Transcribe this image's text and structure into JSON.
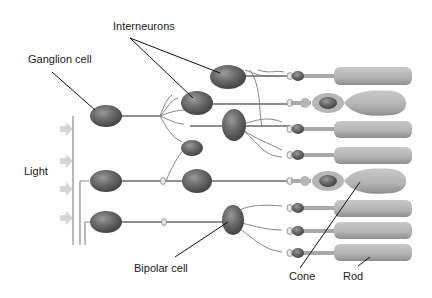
{
  "diagram": {
    "labels": {
      "interneurons": "Interneurons",
      "ganglion_cell": "Ganglion cell",
      "light": "Light",
      "bipolar_cell": "Bipolar cell",
      "cone": "Cone",
      "rod": "Rod"
    },
    "colors": {
      "cell_body": "#6e6e6e",
      "cell_dark": "#4a4a4a",
      "photoreceptor": "#b4b4b4",
      "arrow": "#d4d4d4",
      "line": "#6a6a6a",
      "leader": "#111111"
    },
    "photoreceptors": [
      {
        "type": "rod",
        "y": 76
      },
      {
        "type": "cone",
        "y": 103
      },
      {
        "type": "rod",
        "y": 129
      },
      {
        "type": "rod",
        "y": 155
      },
      {
        "type": "cone",
        "y": 181
      },
      {
        "type": "rod",
        "y": 208
      },
      {
        "type": "rod",
        "y": 231
      },
      {
        "type": "rod",
        "y": 253
      }
    ],
    "light_arrows": 4
  }
}
